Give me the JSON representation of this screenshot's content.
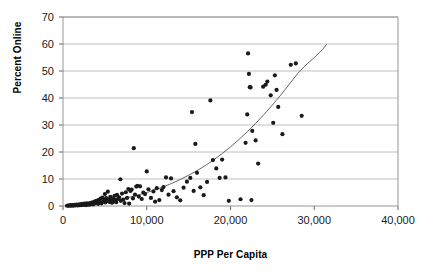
{
  "chart_data": {
    "type": "scatter",
    "title": "",
    "xlabel": "PPP Per Capita",
    "ylabel": "Percent Online",
    "xlim": [
      0,
      40000
    ],
    "ylim": [
      0,
      70
    ],
    "xticks": [
      0,
      10000,
      20000,
      30000,
      40000
    ],
    "xtick_labels": [
      "0",
      "10,000",
      "20,000",
      "30,000",
      "40,000"
    ],
    "yticks": [
      0,
      10,
      20,
      30,
      40,
      50,
      60,
      70
    ],
    "ytick_labels": [
      "0",
      "10",
      "20",
      "30",
      "40",
      "50",
      "60",
      "70"
    ],
    "grid": "horizontal",
    "legend": "none",
    "marker_color": "#1a1a1a",
    "marker_size": 2.1,
    "trendline": {
      "label": "fitted curve",
      "color": "#555555",
      "width": 0.9,
      "points": [
        [
          1000,
          0.15
        ],
        [
          2000,
          0.35
        ],
        [
          3000,
          0.6
        ],
        [
          4000,
          0.95
        ],
        [
          5000,
          1.4
        ],
        [
          6000,
          1.95
        ],
        [
          7000,
          2.6
        ],
        [
          8000,
          3.3
        ],
        [
          9000,
          4.1
        ],
        [
          10000,
          5.0
        ],
        [
          11000,
          6.0
        ],
        [
          12000,
          7.1
        ],
        [
          13000,
          8.4
        ],
        [
          14000,
          9.8
        ],
        [
          15000,
          11.4
        ],
        [
          16000,
          13.1
        ],
        [
          17000,
          15.0
        ],
        [
          18000,
          17.1
        ],
        [
          19000,
          19.4
        ],
        [
          20000,
          21.9
        ],
        [
          21000,
          24.6
        ],
        [
          22000,
          27.5
        ],
        [
          23000,
          30.6
        ],
        [
          24000,
          33.9
        ],
        [
          25000,
          37.4
        ],
        [
          26000,
          41.1
        ],
        [
          27000,
          45.0
        ],
        [
          28000,
          49.0
        ],
        [
          29000,
          52.2
        ],
        [
          30000,
          55.0
        ],
        [
          31000,
          58.0
        ],
        [
          31500,
          60.0
        ]
      ]
    },
    "points": [
      [
        480,
        0.1
      ],
      [
        620,
        0.15
      ],
      [
        760,
        0.2
      ],
      [
        880,
        0.1
      ],
      [
        960,
        0.3
      ],
      [
        1050,
        0.2
      ],
      [
        1180,
        0.15
      ],
      [
        1260,
        0.35
      ],
      [
        1340,
        0.2
      ],
      [
        1420,
        0.4
      ],
      [
        1520,
        0.25
      ],
      [
        1610,
        0.5
      ],
      [
        1700,
        0.3
      ],
      [
        1790,
        0.2
      ],
      [
        1880,
        0.55
      ],
      [
        1960,
        0.35
      ],
      [
        2050,
        0.6
      ],
      [
        2140,
        0.3
      ],
      [
        2230,
        0.7
      ],
      [
        2320,
        0.45
      ],
      [
        2410,
        0.8
      ],
      [
        2500,
        0.4
      ],
      [
        2590,
        0.9
      ],
      [
        2680,
        0.55
      ],
      [
        2770,
        0.35
      ],
      [
        2860,
        1.0
      ],
      [
        2950,
        0.6
      ],
      [
        3040,
        0.8
      ],
      [
        3140,
        0.5
      ],
      [
        3230,
        1.1
      ],
      [
        3320,
        0.7
      ],
      [
        3410,
        1.3
      ],
      [
        3500,
        0.9
      ],
      [
        3600,
        0.6
      ],
      [
        3700,
        1.5
      ],
      [
        3800,
        1.0
      ],
      [
        3900,
        1.8
      ],
      [
        4000,
        1.2
      ],
      [
        4100,
        2.0
      ],
      [
        4200,
        0.8
      ],
      [
        4300,
        2.3
      ],
      [
        4400,
        1.4
      ],
      [
        4500,
        2.7
      ],
      [
        4600,
        1.0
      ],
      [
        4700,
        3.1
      ],
      [
        4800,
        1.7
      ],
      [
        4900,
        2.2
      ],
      [
        5000,
        4.4
      ],
      [
        5050,
        1.3
      ],
      [
        5150,
        2.9
      ],
      [
        5250,
        1.9
      ],
      [
        5350,
        5.3
      ],
      [
        5450,
        2.5
      ],
      [
        5550,
        1.5
      ],
      [
        5650,
        3.4
      ],
      [
        5750,
        2.1
      ],
      [
        5850,
        1.2
      ],
      [
        5950,
        2.8
      ],
      [
        6050,
        1.7
      ],
      [
        6150,
        3.8
      ],
      [
        6250,
        2.3
      ],
      [
        6350,
        1.4
      ],
      [
        6450,
        4.1
      ],
      [
        6550,
        2.6
      ],
      [
        6700,
        3.2
      ],
      [
        6850,
        9.9
      ],
      [
        6900,
        1.9
      ],
      [
        7050,
        4.6
      ],
      [
        7200,
        2.4
      ],
      [
        7350,
        1.1
      ],
      [
        7500,
        5.1
      ],
      [
        7650,
        3.0
      ],
      [
        7800,
        6.3
      ],
      [
        7900,
        0.9
      ],
      [
        8050,
        5.6
      ],
      [
        8200,
        6.1
      ],
      [
        8350,
        2.8
      ],
      [
        8450,
        21.4
      ],
      [
        8600,
        4.2
      ],
      [
        8750,
        7.2
      ],
      [
        8900,
        7.5
      ],
      [
        9050,
        3.5
      ],
      [
        9200,
        7.3
      ],
      [
        9400,
        2.6
      ],
      [
        9600,
        5.0
      ],
      [
        9800,
        4.4
      ],
      [
        10000,
        12.8
      ],
      [
        10200,
        6.2
      ],
      [
        10500,
        3.0
      ],
      [
        10800,
        5.4
      ],
      [
        11000,
        1.6
      ],
      [
        11200,
        6.6
      ],
      [
        11500,
        2.2
      ],
      [
        11800,
        5.9
      ],
      [
        12000,
        7.0
      ],
      [
        12300,
        10.6
      ],
      [
        12600,
        4.2
      ],
      [
        12900,
        10.2
      ],
      [
        13200,
        5.5
      ],
      [
        13600,
        3.2
      ],
      [
        14000,
        2.1
      ],
      [
        14400,
        6.8
      ],
      [
        14800,
        9.0
      ],
      [
        15200,
        10.4
      ],
      [
        15400,
        34.8
      ],
      [
        15600,
        5.6
      ],
      [
        15800,
        23.0
      ],
      [
        16000,
        12.3
      ],
      [
        16400,
        6.9
      ],
      [
        16800,
        4.0
      ],
      [
        17200,
        8.9
      ],
      [
        17600,
        39.1
      ],
      [
        17900,
        17.0
      ],
      [
        18300,
        13.9
      ],
      [
        18700,
        10.4
      ],
      [
        19000,
        17.2
      ],
      [
        19400,
        10.6
      ],
      [
        19800,
        1.9
      ],
      [
        21200,
        2.5
      ],
      [
        21800,
        23.4
      ],
      [
        22000,
        33.9
      ],
      [
        22100,
        56.5
      ],
      [
        22200,
        48.9
      ],
      [
        22300,
        44.0
      ],
      [
        22400,
        43.9
      ],
      [
        22500,
        2.2
      ],
      [
        22600,
        27.8
      ],
      [
        23000,
        24.3
      ],
      [
        23300,
        15.7
      ],
      [
        23900,
        44.2
      ],
      [
        24200,
        44.9
      ],
      [
        24400,
        46.1
      ],
      [
        24800,
        41.0
      ],
      [
        25100,
        30.8
      ],
      [
        25300,
        48.4
      ],
      [
        25500,
        43.0
      ],
      [
        25700,
        36.7
      ],
      [
        26200,
        26.6
      ],
      [
        27200,
        52.3
      ],
      [
        27800,
        52.8
      ],
      [
        28500,
        33.4
      ]
    ]
  }
}
